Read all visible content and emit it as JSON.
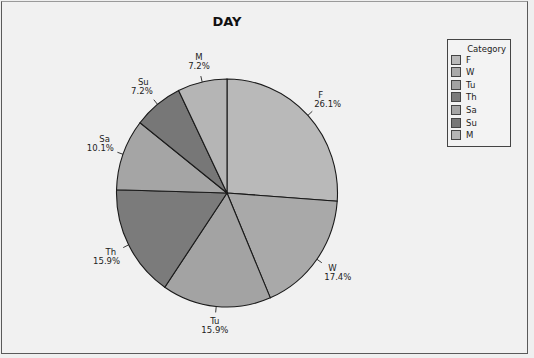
{
  "chart_data": {
    "type": "pie",
    "title": "DAY",
    "legend": {
      "title": "Category",
      "position": "right"
    },
    "categories": [
      "F",
      "W",
      "Tu",
      "Th",
      "Sa",
      "Su",
      "M"
    ],
    "values": [
      26.1,
      17.4,
      15.9,
      15.9,
      10.1,
      7.2,
      7.2
    ],
    "labels": [
      "26.1%",
      "17.4%",
      "15.9%",
      "15.9%",
      "10.1%",
      "7.2%",
      "7.2%"
    ],
    "start_angle": "12 o'clock",
    "direction": "clockwise",
    "colors": [
      "#b9b9b9",
      "#a9a9a9",
      "#a3a3a3",
      "#7b7b7b",
      "#a5a5a5",
      "#777777",
      "#b5b5b5"
    ]
  },
  "legend_items": [
    {
      "label": "F"
    },
    {
      "label": "W"
    },
    {
      "label": "Tu"
    },
    {
      "label": "Th"
    },
    {
      "label": "Sa"
    },
    {
      "label": "Su"
    },
    {
      "label": "M"
    }
  ]
}
